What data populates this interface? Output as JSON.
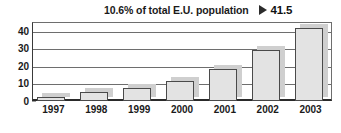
{
  "chart_data": {
    "type": "bar",
    "title": "",
    "subtitle": "",
    "xlabel": "",
    "ylabel": "",
    "categories": [
      "1997",
      "1998",
      "1999",
      "2000",
      "2001",
      "2002",
      "2003"
    ],
    "values": [
      2.5,
      5.2,
      7.5,
      11.5,
      18.5,
      29,
      41.5
    ],
    "ylim": [
      0,
      45
    ],
    "yticks": [
      0,
      10,
      20,
      30,
      40
    ],
    "ytick_labels": [
      "0",
      "10",
      "20",
      "30",
      "40"
    ],
    "grid": true,
    "legend": false,
    "legend_position": "none",
    "series": [
      {
        "name": "",
        "values": [
          2.5,
          5.2,
          7.5,
          11.5,
          18.5,
          29,
          41.5
        ]
      }
    ],
    "annotations": [
      {
        "text": "10.6% of total E.U. population",
        "marker": "right-triangle",
        "value": "41.5",
        "target_category": "2003",
        "position": "top"
      }
    ],
    "colors": {
      "bar_fill": "#e3e3e3",
      "bar_border": "#4a4a4a",
      "bar_shadow": "#cfcfcf",
      "gridline": "#6e6e6e",
      "axis": "#2a2a2a",
      "text": "#1a1a1a",
      "background": "#ffffff"
    }
  }
}
